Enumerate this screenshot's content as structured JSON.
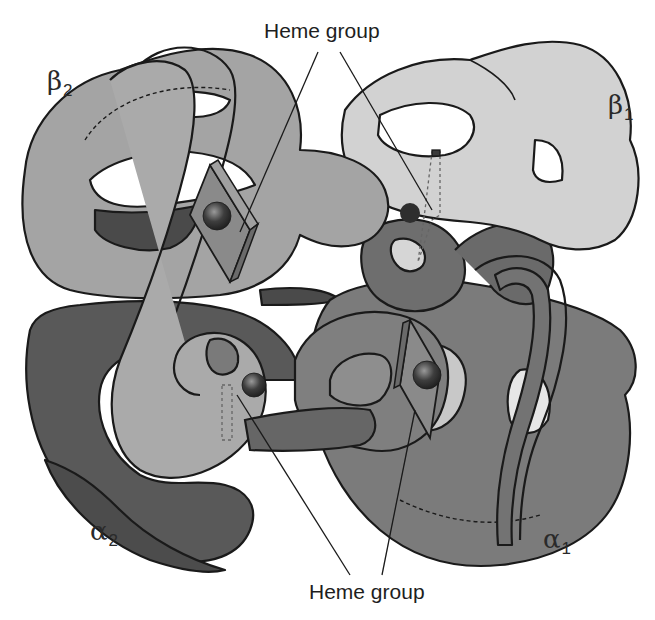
{
  "figure": {
    "callouts": {
      "top": {
        "label": "Heme group"
      },
      "bottom": {
        "label": "Heme group"
      }
    },
    "subunits": [
      {
        "id": "beta2",
        "symbol": "β",
        "index": "2",
        "color": "#a4a4a4"
      },
      {
        "id": "beta1",
        "symbol": "β",
        "index": "1",
        "color": "#d2d2d2"
      },
      {
        "id": "alpha2",
        "symbol": "α",
        "index": "2",
        "color": "#595959"
      },
      {
        "id": "alpha1",
        "symbol": "α",
        "index": "1",
        "color": "#7b7b7b"
      }
    ],
    "colors": {
      "outline": "#1a1a1a",
      "heme_plane": "#8a8a8a",
      "iron": "#3a3a3a",
      "background": "#ffffff"
    }
  }
}
